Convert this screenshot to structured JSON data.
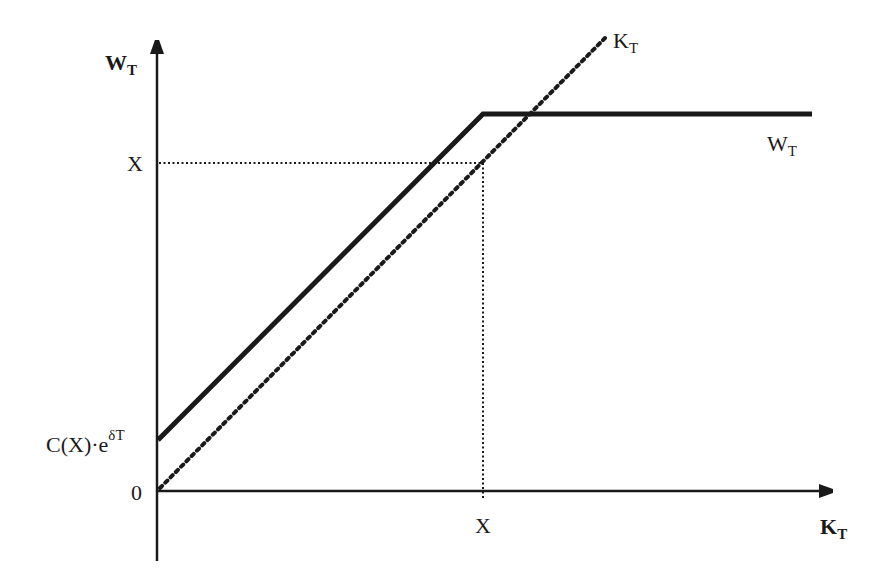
{
  "diagram": {
    "axes": {
      "y_label": "W",
      "y_label_sub": "T",
      "x_label": "K",
      "x_label_sub": "T"
    },
    "ticks": {
      "y_X": "X",
      "y_intercept_main": "C(X)·e",
      "y_intercept_sup": "δT",
      "origin": "0",
      "x_X": "X"
    },
    "curves": {
      "diagonal_label": "K",
      "diagonal_label_sub": "T",
      "payoff_label": "W",
      "payoff_label_sub": "T"
    },
    "colors": {
      "ink": "#1a1a1a",
      "background": "#ffffff"
    }
  }
}
